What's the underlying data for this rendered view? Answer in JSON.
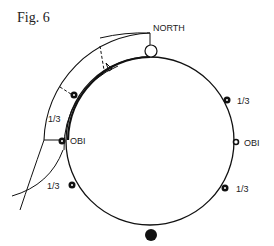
{
  "figure": {
    "title": "Fig. 6",
    "labels": {
      "north": "NORTH",
      "obi_left": "OBI",
      "obi_right": "OBI",
      "third_upper_left": "1/3",
      "third_lower_left": "1/3",
      "third_upper_right": "1/3",
      "third_lower_right": "1/3"
    },
    "colors": {
      "line": "#111111",
      "background": "#ffffff"
    }
  }
}
